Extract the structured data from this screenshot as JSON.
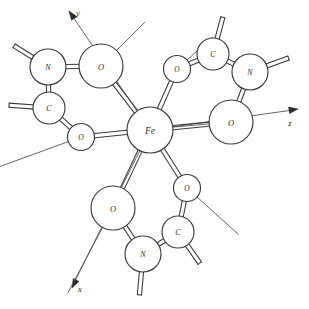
{
  "figure": {
    "background_color": "#ffffff",
    "line_color": "#3a3a3a",
    "label_color": "#2e2e2e",
    "width": 309,
    "height": 309
  },
  "chart_data": {
    "type": "diagram",
    "center_atom": "Fe",
    "coordination_number": 6,
    "ligand_count": 3,
    "element_counts": {
      "Fe": 1,
      "O": 6,
      "N": 3,
      "C": 3
    }
  },
  "axes": {
    "items": [
      {
        "id": "axis-y",
        "label": "y",
        "label_x": 78,
        "label_y": 13,
        "x1": 150,
        "y1": 130,
        "x2": 73,
        "y2": 17,
        "head_x": 69,
        "head_y": 11,
        "head_angle": 235
      },
      {
        "id": "axis-z",
        "label": "z",
        "label_x": 290,
        "label_y": 123,
        "x1": 150,
        "y1": 130,
        "x2": 293,
        "y2": 110,
        "head_x": 298,
        "head_y": 109,
        "head_angle": 352
      },
      {
        "id": "axis-x",
        "label": "x",
        "label_x": 80,
        "label_y": 289,
        "x1": 150,
        "y1": 130,
        "x2": 75,
        "y2": 281,
        "head_x": 72,
        "head_y": 288,
        "head_angle": 117
      }
    ]
  },
  "atoms": [
    {
      "id": "fe-center",
      "label": "Fe",
      "x": 150,
      "y": 130,
      "r": 23,
      "font_size": 9.5
    },
    {
      "id": "o-upper-left-large",
      "label": "O",
      "x": 101,
      "y": 66,
      "r": 22,
      "font_size": 8.5
    },
    {
      "id": "n-upper-left",
      "label": "N",
      "x": 48,
      "y": 67,
      "r": 18,
      "font_size": 8
    },
    {
      "id": "c-upper-left",
      "label": "C",
      "x": 49,
      "y": 108,
      "r": 16,
      "font_size": 8
    },
    {
      "id": "o-left-small",
      "label": "O",
      "x": 81,
      "y": 137,
      "r": 13.5,
      "font_size": 7.5
    },
    {
      "id": "o-upper-right-small",
      "label": "O",
      "x": 177,
      "y": 69,
      "r": 13.5,
      "font_size": 7.5
    },
    {
      "id": "c-upper-right",
      "label": "C",
      "x": 213,
      "y": 54,
      "r": 16,
      "font_size": 8
    },
    {
      "id": "n-upper-right",
      "label": "N",
      "x": 250,
      "y": 72,
      "r": 18,
      "font_size": 8
    },
    {
      "id": "o-right-large",
      "label": "O",
      "x": 231,
      "y": 122,
      "r": 22,
      "font_size": 8.5
    },
    {
      "id": "o-bottom-left-large",
      "label": "O",
      "x": 113,
      "y": 208,
      "r": 22,
      "font_size": 8.5
    },
    {
      "id": "n-bottom",
      "label": "N",
      "x": 143,
      "y": 254,
      "r": 18,
      "font_size": 8
    },
    {
      "id": "c-bottom-right",
      "label": "C",
      "x": 178,
      "y": 232,
      "r": 16,
      "font_size": 8
    },
    {
      "id": "o-bottom-small",
      "label": "O",
      "x": 187,
      "y": 188,
      "r": 13.5,
      "font_size": 7.5
    }
  ],
  "bonds": [
    {
      "id": "bond-fe-o-ul",
      "from": "fe-center",
      "to": "o-upper-left-large",
      "style": "tube"
    },
    {
      "id": "bond-fe-o-left",
      "from": "fe-center",
      "to": "o-left-small",
      "style": "tube"
    },
    {
      "id": "bond-fe-o-ur",
      "from": "fe-center",
      "to": "o-upper-right-small",
      "style": "tube"
    },
    {
      "id": "bond-fe-o-right",
      "from": "fe-center",
      "to": "o-right-large",
      "style": "tube"
    },
    {
      "id": "bond-fe-o-bl",
      "from": "fe-center",
      "to": "o-bottom-left-large",
      "style": "tube"
    },
    {
      "id": "bond-fe-o-bottom",
      "from": "fe-center",
      "to": "o-bottom-small",
      "style": "tube"
    },
    {
      "id": "bond-n-o-ul",
      "from": "n-upper-left",
      "to": "o-upper-left-large",
      "style": "tube"
    },
    {
      "id": "bond-n-c-ul",
      "from": "n-upper-left",
      "to": "c-upper-left",
      "style": "tube"
    },
    {
      "id": "bond-c-o-ul",
      "from": "c-upper-left",
      "to": "o-left-small",
      "style": "tube"
    },
    {
      "id": "bond-o-c-ur",
      "from": "o-upper-right-small",
      "to": "c-upper-right",
      "style": "tube"
    },
    {
      "id": "bond-c-n-ur",
      "from": "c-upper-right",
      "to": "n-upper-right",
      "style": "tube"
    },
    {
      "id": "bond-n-o-ur",
      "from": "n-upper-right",
      "to": "o-right-large",
      "style": "tube"
    },
    {
      "id": "bond-o-n-bl",
      "from": "o-bottom-left-large",
      "to": "n-bottom",
      "style": "tube"
    },
    {
      "id": "bond-n-c-b",
      "from": "n-bottom",
      "to": "c-bottom-right",
      "style": "tube"
    },
    {
      "id": "bond-c-o-b",
      "from": "c-bottom-right",
      "to": "o-bottom-small",
      "style": "tube"
    }
  ],
  "substituents": [
    {
      "id": "stub-n-upper-left",
      "atom": "n-upper-left",
      "angle": 212,
      "length": 22,
      "style": "tube"
    },
    {
      "id": "stub-c-upper-left",
      "atom": "c-upper-left",
      "angle": 184,
      "length": 24,
      "style": "tube"
    },
    {
      "id": "stub-c-upper-right",
      "atom": "c-upper-right",
      "angle": 285,
      "length": 22,
      "style": "tube"
    },
    {
      "id": "stub-n-upper-right",
      "atom": "n-upper-right",
      "angle": 340,
      "length": 23,
      "style": "tube"
    },
    {
      "id": "stub-n-bottom",
      "atom": "n-bottom",
      "angle": 95,
      "length": 23,
      "style": "tube"
    },
    {
      "id": "stub-c-bottom-right",
      "atom": "c-bottom-right",
      "angle": 55,
      "length": 22,
      "style": "tube"
    }
  ],
  "lone_pair_lines": [
    {
      "id": "lp-o-upper-left",
      "atom": "o-upper-left-large",
      "angle": 315,
      "length": 40,
      "inward": true
    },
    {
      "id": "lp-o-upper-right",
      "atom": "o-upper-right-small",
      "angle": 318,
      "length": 34,
      "inward": true
    },
    {
      "id": "lp-o-right",
      "atom": "o-right-large",
      "angle": 175,
      "length": 38,
      "inward": true
    },
    {
      "id": "lp-o-left-small",
      "atom": "o-left-small",
      "angle": 160,
      "length": 76,
      "inward": false
    },
    {
      "id": "lp-o-bottom-small",
      "atom": "o-bottom-small",
      "angle": 42,
      "length": 56,
      "inward": false
    },
    {
      "id": "lp-o-bottom-left",
      "atom": "o-bottom-left-large",
      "angle": 118,
      "length": 74,
      "inward": false
    }
  ]
}
